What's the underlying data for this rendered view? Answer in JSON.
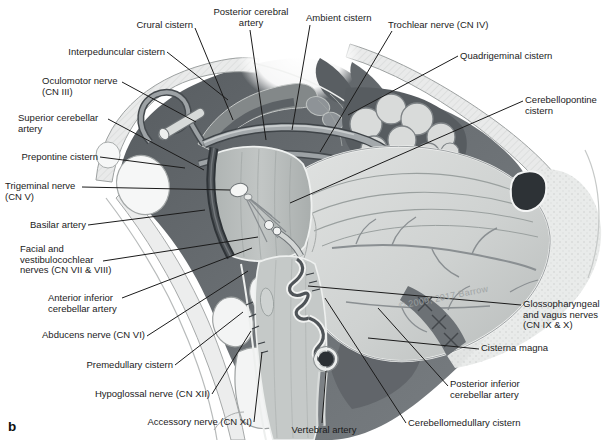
{
  "panel": {
    "letter": "b"
  },
  "watermark": {
    "text": "© 2009, 2017 Barrow"
  },
  "labels": {
    "crural_cistern": {
      "text": "Crural cistern"
    },
    "posterior_cerebral_artery": {
      "text": "Posterior cerebral\nartery"
    },
    "ambient_cistern": {
      "text": "Ambient cistern"
    },
    "trochlear_nerve": {
      "text": "Trochlear nerve (CN IV)"
    },
    "interpeduncular_cistern": {
      "text": "Interpeduncular cistern"
    },
    "quadrigeminal_cistern": {
      "text": "Quadrigeminal cistern"
    },
    "oculomotor_nerve": {
      "text": "Oculomotor nerve\n(CN III)"
    },
    "cerebellopontine_cistern": {
      "text": "Cerebellopontine\ncistern"
    },
    "superior_cerebellar_artery": {
      "text": "Superior cerebellar\nartery"
    },
    "prepontine_cistern": {
      "text": "Prepontine cistern"
    },
    "trigeminal_nerve": {
      "text": "Trigeminal nerve\n(CN V)"
    },
    "basilar_artery": {
      "text": "Basilar artery"
    },
    "facial_vestibulocochlear_nerves": {
      "text": "Facial and\nvestibulocochlear\nnerves (CN VII & VIII)"
    },
    "anterior_inferior_cerebellar_artery": {
      "text": "Anterior inferior\ncerebellar artery"
    },
    "abducens_nerve": {
      "text": "Abducens nerve (CN VI)"
    },
    "premedullary_cistern": {
      "text": "Premedullary cistern"
    },
    "hypoglossal_nerve": {
      "text": "Hypoglossal nerve (CN XII)"
    },
    "accessory_nerve": {
      "text": "Accessory nerve (CN XI)"
    },
    "vertebral_artery": {
      "text": "Vertebral artery"
    },
    "cerebellomedullary_cistern": {
      "text": "Cerebellomedullary cistern"
    },
    "posterior_inferior_cerebellar_artery": {
      "text": "Posterior inferior\ncerebellar artery"
    },
    "cisterna_magna": {
      "text": "Cisterna magna"
    },
    "glossopharyngeal_vagus_nerves": {
      "text": "Glossopharyngeal\nand vagus nerves\n(CN IX & X)"
    }
  },
  "colors": {
    "label_text": "#1b1b1b",
    "leader_line": "#1b1b1b",
    "csf_dark": "#5b6064",
    "brain_light": "#d4d7d6",
    "bone": "#e9eaea",
    "vessel_dark": "#2f3438",
    "watermark_gray": "#9ca1a2"
  }
}
